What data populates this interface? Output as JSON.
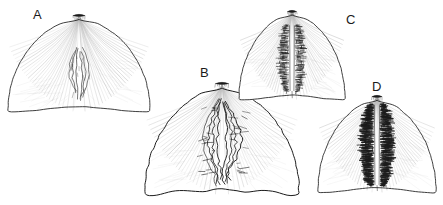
{
  "figure": {
    "kind": "scientific-line-drawing",
    "background_color": "#ffffff",
    "ink_color": "#1b1b1b",
    "vein_color": "#b9b9b9",
    "panel_count": 4
  },
  "labels": {
    "a": "A",
    "b": "B",
    "c": "C",
    "d": "D"
  },
  "panels": [
    {
      "id": "a",
      "label": "A",
      "label_x": 33,
      "label_y": 8,
      "center_x": 79,
      "center_y": 70,
      "half_width": 71,
      "apex_y": 14,
      "base_y": 112,
      "pigment_density": "sparse",
      "pigment_style": "thin-paired-loops",
      "margin_style": "smooth-with-slight-crenulation"
    },
    {
      "id": "b",
      "label": "B",
      "label_x": 200,
      "label_y": 66,
      "center_x": 222,
      "center_y": 140,
      "half_width": 77,
      "apex_y": 82,
      "base_y": 195,
      "pigment_density": "moderate",
      "pigment_style": "jagged-wavy-branching-lines",
      "margin_style": "strongly-crenulate"
    },
    {
      "id": "c",
      "label": "C",
      "label_x": 346,
      "label_y": 13,
      "center_x": 292,
      "center_y": 56,
      "half_width": 53,
      "apex_y": 10,
      "base_y": 100,
      "pigment_density": "dense",
      "pigment_style": "feathered-horizontal-hatching",
      "margin_style": "smooth-rounded"
    },
    {
      "id": "d",
      "label": "D",
      "label_x": 372,
      "label_y": 80,
      "center_x": 377,
      "center_y": 146,
      "half_width": 59,
      "apex_y": 95,
      "base_y": 193,
      "pigment_density": "very-dense",
      "pigment_style": "thick-dark-feathered-band",
      "margin_style": "smooth-rounded-notched-base"
    }
  ]
}
